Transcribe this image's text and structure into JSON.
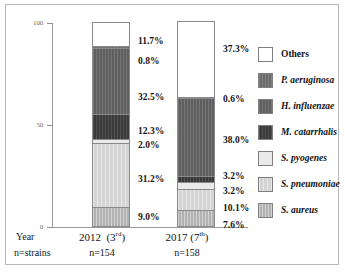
{
  "chart_data": {
    "type": "bar",
    "subtype": "stacked-100-percent",
    "title": "",
    "xlabel": "",
    "ylabel": "",
    "ylim": [
      0,
      100
    ],
    "yticks": [
      "0",
      "50",
      "100"
    ],
    "grid": false,
    "legend_position": "right",
    "categories": [
      "2012",
      "2017"
    ],
    "category_annotations": [
      "(3rd)",
      "(7th)"
    ],
    "category_ordinals": [
      "3",
      "7"
    ],
    "category_ordinal_suffixes": [
      "rd",
      "th"
    ],
    "category_sample_labels": [
      "n=154",
      "n=158"
    ],
    "sample_sizes": [
      154,
      158
    ],
    "row_header_year": "Year",
    "row_header_n": "n=strains",
    "series": [
      {
        "name": "Others",
        "style": "white",
        "color": "#ffffff",
        "values": [
          11.7,
          37.3
        ],
        "labels": [
          "11.7%",
          "37.3%"
        ]
      },
      {
        "name": "P. aeruginosa",
        "style": "dark-gray",
        "color": "#6b6b6b",
        "values": [
          0.8,
          0.6
        ],
        "labels": [
          "0.8%",
          "0.6%"
        ]
      },
      {
        "name": "H. influenzae",
        "style": "dark-gray-2",
        "color": "#5e5e5e",
        "values": [
          32.5,
          38.0
        ],
        "labels": [
          "32.5%",
          "38.0%"
        ]
      },
      {
        "name": "M. catarrhalis",
        "style": "near-black",
        "color": "#3a3a3a",
        "values": [
          12.3,
          3.2
        ],
        "labels": [
          "12.3%",
          "3.2%"
        ]
      },
      {
        "name": "S. pyogenes",
        "style": "very-light",
        "color": "#eaeaea",
        "values": [
          2.0,
          3.2
        ],
        "labels": [
          "2.0%",
          "3.2%"
        ]
      },
      {
        "name": "S. pneumoniae",
        "style": "light-gray",
        "color": "#d4d4d4",
        "values": [
          31.2,
          10.1
        ],
        "labels": [
          "31.2%",
          "10.1%"
        ]
      },
      {
        "name": "S. aureus",
        "style": "mid-gray",
        "color": "#b2b2b2",
        "values": [
          9.0,
          7.6
        ],
        "labels": [
          "9.0%",
          "7.6%"
        ]
      }
    ]
  },
  "legend": {
    "items": [
      {
        "label": "Others",
        "italic": false
      },
      {
        "label": "P. aeruginosa",
        "italic": true
      },
      {
        "label": "H. influenzae",
        "italic": true
      },
      {
        "label": "M. catarrhalis",
        "italic": true
      },
      {
        "label": "S. pyogenes",
        "italic": true
      },
      {
        "label": "S. pneumoniae",
        "italic": true
      },
      {
        "label": "S. aureus",
        "italic": true
      }
    ]
  }
}
